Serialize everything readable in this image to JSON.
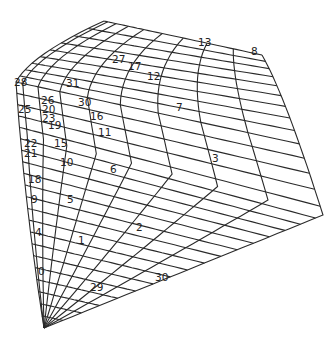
{
  "diagram": {
    "type": "structured-mesh",
    "colors": {
      "line": "#2a2a2a",
      "text": "#222222",
      "background": "#ffffff"
    },
    "outline": {
      "top_left": [
        16,
        80
      ],
      "apex": [
        104,
        21
      ],
      "top_right": [
        262,
        55
      ],
      "right_corner": [
        323,
        215
      ],
      "bottom_right": [
        323,
        215
      ],
      "bottom_left": [
        44,
        328
      ]
    },
    "grid": {
      "u_divisions": 9,
      "v_divisions": 30
    },
    "labels": [
      {
        "text": "28",
        "x": 14,
        "y": 86
      },
      {
        "text": "25",
        "x": 18,
        "y": 113
      },
      {
        "text": "26",
        "x": 41,
        "y": 104
      },
      {
        "text": "31",
        "x": 66,
        "y": 87
      },
      {
        "text": "20",
        "x": 42,
        "y": 113
      },
      {
        "text": "23",
        "x": 42,
        "y": 122
      },
      {
        "text": "19",
        "x": 48,
        "y": 129
      },
      {
        "text": "30",
        "x": 78,
        "y": 106
      },
      {
        "text": "16",
        "x": 90,
        "y": 120
      },
      {
        "text": "11",
        "x": 98,
        "y": 136
      },
      {
        "text": "27",
        "x": 112,
        "y": 63
      },
      {
        "text": "17",
        "x": 128,
        "y": 70
      },
      {
        "text": "12",
        "x": 147,
        "y": 80
      },
      {
        "text": "13",
        "x": 198,
        "y": 46
      },
      {
        "text": "8",
        "x": 251,
        "y": 55
      },
      {
        "text": "7",
        "x": 176,
        "y": 111
      },
      {
        "text": "22",
        "x": 24,
        "y": 147
      },
      {
        "text": "21",
        "x": 24,
        "y": 157
      },
      {
        "text": "15",
        "x": 54,
        "y": 147
      },
      {
        "text": "10",
        "x": 60,
        "y": 166
      },
      {
        "text": "6",
        "x": 110,
        "y": 173
      },
      {
        "text": "3",
        "x": 212,
        "y": 162
      },
      {
        "text": "18",
        "x": 28,
        "y": 183
      },
      {
        "text": "9",
        "x": 31,
        "y": 203
      },
      {
        "text": "5",
        "x": 67,
        "y": 203
      },
      {
        "text": "4",
        "x": 35,
        "y": 236
      },
      {
        "text": "2",
        "x": 136,
        "y": 231
      },
      {
        "text": "1",
        "x": 78,
        "y": 244
      },
      {
        "text": "0",
        "x": 38,
        "y": 275
      },
      {
        "text": "29",
        "x": 90,
        "y": 291
      },
      {
        "text": "30",
        "x": 155,
        "y": 281
      }
    ]
  }
}
